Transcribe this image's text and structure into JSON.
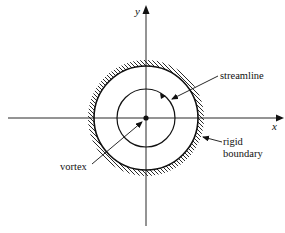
{
  "diagram": {
    "type": "fluid-flow-schematic",
    "axes": {
      "x_label": "x",
      "y_label": "y"
    },
    "labels": {
      "streamline": "streamline",
      "rigid_boundary_line1": "rigid",
      "rigid_boundary_line2": "boundary",
      "vortex": "vortex"
    },
    "elements": [
      {
        "id": "vortex",
        "kind": "point",
        "description": "point vortex at origin"
      },
      {
        "id": "streamline",
        "kind": "circle",
        "description": "circular streamline around vortex"
      },
      {
        "id": "rigid-boundary",
        "kind": "hatched-circle",
        "description": "circular rigid boundary with hatching outside"
      }
    ],
    "colors": {
      "ink": "#111111",
      "background": "#ffffff"
    }
  }
}
